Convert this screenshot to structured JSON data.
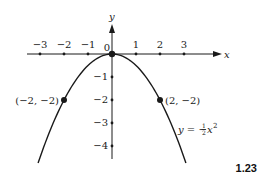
{
  "figure_number": "1.23",
  "chart_data": {
    "type": "line",
    "title": "",
    "xlabel": "x",
    "ylabel": "y",
    "equation": "y = -½x²",
    "function": "y = -0.5 * x^2",
    "x_ticks": [
      "−3",
      "−2",
      "−1",
      "0",
      "1",
      "2",
      "3"
    ],
    "y_ticks": [
      "−1",
      "−2",
      "−3",
      "−4"
    ],
    "origin_label": "0",
    "xlim": [
      -3.3,
      4.4
    ],
    "ylim": [
      -4.8,
      1.3
    ],
    "grid": false,
    "series": [
      {
        "name": "y = -½x²",
        "x": [
          -3.08,
          -2,
          -1,
          0,
          1,
          2,
          3.08
        ],
        "values": [
          -4.74,
          -2,
          -0.5,
          0,
          -0.5,
          -2,
          -4.74
        ]
      }
    ],
    "highlighted_points": [
      {
        "x": -2,
        "y": -2,
        "label": "(−2, −2)"
      },
      {
        "x": 0,
        "y": 0,
        "label": ""
      },
      {
        "x": 2,
        "y": -2,
        "label": "(2, −2)"
      }
    ]
  },
  "colors": {
    "ink": "#1a1a1a",
    "background": "#ffffff"
  }
}
